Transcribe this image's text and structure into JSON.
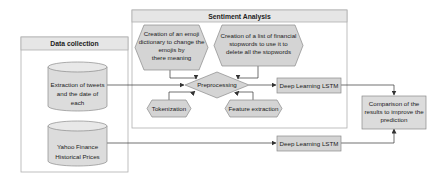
{
  "diagram": {
    "groups": {
      "sentiment_analysis": {
        "title": "Sentiment Analysis"
      },
      "data_collection": {
        "title": "Data collection"
      }
    },
    "nodes": {
      "emoji_dictionary": {
        "shape": "hexagon",
        "lines": [
          "Creation of an emoji",
          "dictionary to change the",
          "emojis by",
          "there meaning"
        ]
      },
      "stopwords": {
        "shape": "hexagon",
        "lines": [
          "Creation of a list of financial",
          "stopwords to use it to",
          "delete all the stopwords"
        ]
      },
      "preprocessing": {
        "shape": "diamond",
        "label": "Preprocessing"
      },
      "tokenization": {
        "shape": "hexagon",
        "label": "Tokenization"
      },
      "feature_extraction": {
        "shape": "hexagon",
        "label": "Feature extraction"
      },
      "lstm_sentiment": {
        "shape": "rectangle",
        "label": "Deep Learning LSTM"
      },
      "lstm_prices": {
        "shape": "rectangle",
        "label": "Deep Learning LSTM"
      },
      "tweets_db": {
        "shape": "cylinder",
        "lines": [
          "Extraction of tweets",
          "and the date of",
          "each"
        ]
      },
      "yahoo_db": {
        "shape": "cylinder",
        "lines": [
          "Yahoo Finance",
          "Historical Prices"
        ]
      },
      "comparison": {
        "shape": "rectangle",
        "lines": [
          "Comparison of the",
          "results to improve the",
          "prediction"
        ]
      }
    },
    "edges": [
      {
        "from": "tweets_db",
        "to": "preprocessing"
      },
      {
        "from": "emoji_dictionary",
        "to": "preprocessing"
      },
      {
        "from": "stopwords",
        "to": "preprocessing"
      },
      {
        "from": "tokenization",
        "to": "preprocessing"
      },
      {
        "from": "feature_extraction",
        "to": "preprocessing"
      },
      {
        "from": "preprocessing",
        "to": "lstm_sentiment"
      },
      {
        "from": "lstm_sentiment",
        "to": "comparison"
      },
      {
        "from": "yahoo_db",
        "to": "lstm_prices"
      },
      {
        "from": "lstm_prices",
        "to": "comparison"
      }
    ],
    "colors": {
      "node_fill": "#d4d4d4",
      "node_stroke": "#8a8a8a",
      "group_header_fill": "#e6e6e6",
      "group_stroke": "#b0b0b0",
      "edge": "#333333"
    }
  }
}
